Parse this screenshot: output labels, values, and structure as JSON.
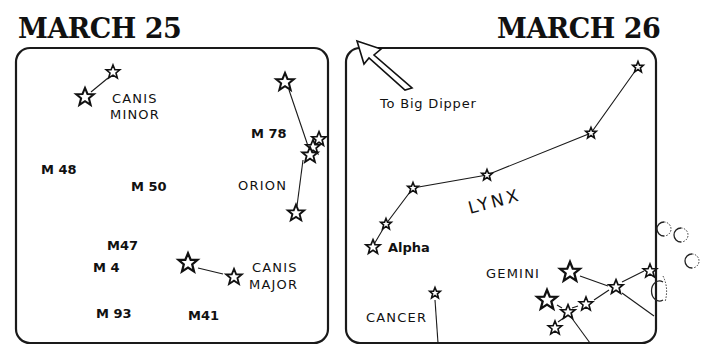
{
  "panels": [
    {
      "title": "MARCH 25",
      "labels": {
        "canis_minor_1": "CANIS",
        "canis_minor_2": "MINOR",
        "m78": "M 78",
        "m48": "M 48",
        "m50": "M 50",
        "orion": "ORION",
        "m47": "M47",
        "m4": "M 4",
        "canis_major_1": "CANIS",
        "canis_major_2": "MAJOR",
        "m41": "M41",
        "m93": "M 93"
      }
    },
    {
      "title": "MARCH 26",
      "labels": {
        "big_dipper": "To Big Dipper",
        "lynx": "LYNX",
        "alpha": "Alpha",
        "gemini": "GEMINI",
        "cancer": "CANCER"
      }
    }
  ],
  "colors": {
    "ink": "#111111",
    "paper": "#ffffff"
  }
}
